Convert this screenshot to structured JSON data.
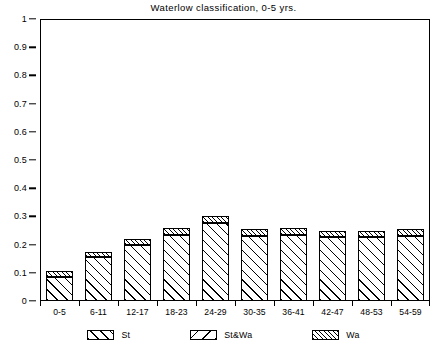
{
  "chart_data": {
    "type": "bar",
    "title": "Waterlow classification, 0-5 yrs.",
    "xlabel": "",
    "ylabel": "",
    "ylim": [
      0,
      1
    ],
    "xlim_note": "categorical",
    "grid": false,
    "stacked": true,
    "legend_position": "bottom",
    "categories": [
      "0-5",
      "6-11",
      "12-17",
      "18-23",
      "24-29",
      "30-35",
      "36-41",
      "42-47",
      "48-53",
      "54-59"
    ],
    "y_ticks": [
      "0",
      "0.1",
      "0.2",
      "0.3",
      "0.4",
      "0.5",
      "0.6",
      "0.7",
      "0.8",
      "0.9",
      "1"
    ],
    "y_tick_values": [
      0,
      0.1,
      0.2,
      0.3,
      0.4,
      0.5,
      0.6,
      0.7,
      0.8,
      0.9,
      1
    ],
    "series": [
      {
        "name": "St",
        "hatch": "seg-st",
        "values": [
          0.085,
          0.155,
          0.198,
          0.233,
          0.277,
          0.232,
          0.235,
          0.228,
          0.228,
          0.232
        ]
      },
      {
        "name": "St&Wa",
        "hatch": "seg-stwa",
        "values": [
          0,
          0,
          0,
          0,
          0,
          0,
          0,
          0,
          0,
          0
        ]
      },
      {
        "name": "Wa",
        "hatch": "seg-wa",
        "values": [
          0.02,
          0.02,
          0.022,
          0.027,
          0.023,
          0.023,
          0.023,
          0.022,
          0.022,
          0.023
        ]
      }
    ],
    "totals": [
      0.105,
      0.175,
      0.22,
      0.26,
      0.3,
      0.255,
      0.258,
      0.25,
      0.25,
      0.255
    ],
    "legend": [
      {
        "label": "St",
        "hatch": "seg-st"
      },
      {
        "label": "St&Wa",
        "hatch": "seg-stwa"
      },
      {
        "label": "Wa",
        "hatch": "seg-wa"
      }
    ],
    "colors": {
      "ink": "#000000",
      "background": "#ffffff"
    }
  }
}
